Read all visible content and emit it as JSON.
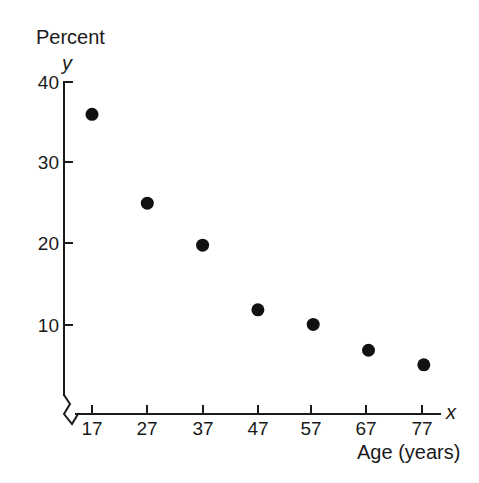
{
  "chart_data": {
    "type": "scatter",
    "title": "",
    "ylabel": "Percent",
    "xlabel": "Age (years)",
    "y_axis_symbol": "y",
    "x_axis_symbol": "x",
    "x": [
      17,
      27,
      37,
      47,
      57,
      67,
      77
    ],
    "xticklabels": [
      "17",
      "27",
      "37",
      "47",
      "57",
      "67",
      "77"
    ],
    "yticks": [
      10,
      20,
      30,
      40
    ],
    "yticklabels": [
      "10",
      "20",
      "30",
      "40"
    ],
    "values": [
      36,
      25,
      19.8,
      11.8,
      10,
      6.8,
      5
    ],
    "points": [
      {
        "x": 17,
        "y": 36
      },
      {
        "x": 27,
        "y": 25
      },
      {
        "x": 37,
        "y": 19.8
      },
      {
        "x": 47,
        "y": 11.8
      },
      {
        "x": 57,
        "y": 10
      },
      {
        "x": 67,
        "y": 6.8
      },
      {
        "x": 77,
        "y": 5
      }
    ],
    "xlim": [
      12,
      82
    ],
    "ylim": [
      0,
      40
    ],
    "grid": false,
    "legend": null,
    "axis_break": "y-axis broken near origin",
    "marker_color": "#111111",
    "axis_color": "#1a1a1a",
    "background_color": "#ffffff"
  }
}
